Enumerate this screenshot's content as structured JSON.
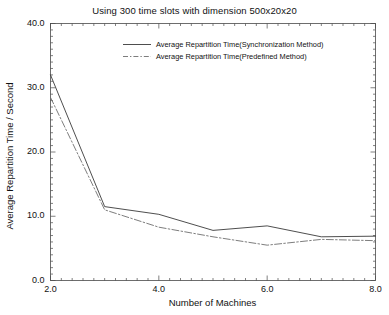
{
  "chart_data": {
    "type": "line",
    "title": "Using 300 time slots with dimension 500x20x20",
    "xlabel": "Number of Machines",
    "ylabel": "Average Repartition Time / Second",
    "xlim": [
      2.0,
      8.0
    ],
    "ylim": [
      0.0,
      40.0
    ],
    "grid": false,
    "legend_position": "top-center",
    "xticks": [
      "2.0",
      "4.0",
      "6.0",
      "8.0"
    ],
    "xtick_values": [
      2.0,
      4.0,
      6.0,
      8.0
    ],
    "yticks": [
      "0.0",
      "10.0",
      "20.0",
      "30.0",
      "40.0"
    ],
    "ytick_values": [
      0.0,
      10.0,
      20.0,
      30.0,
      40.0
    ],
    "x": [
      2,
      3,
      4,
      5,
      6,
      7,
      8
    ],
    "series": [
      {
        "name": "Average Repartition Time(Synchronization Method)",
        "style": "solid",
        "color": "#3a3a3a",
        "values": [
          32.0,
          11.5,
          10.3,
          7.8,
          8.5,
          6.8,
          6.9
        ]
      },
      {
        "name": "Average Repartition Time(Predefined Method)",
        "style": "dashdot",
        "color": "#6e6e6e",
        "values": [
          28.5,
          11.0,
          8.3,
          6.8,
          5.5,
          6.4,
          6.2
        ]
      }
    ]
  },
  "colors": {
    "axis": "#4a4a4a",
    "series_solid": "#3a3a3a",
    "series_dashed": "#6e6e6e",
    "background": "#ffffff"
  }
}
